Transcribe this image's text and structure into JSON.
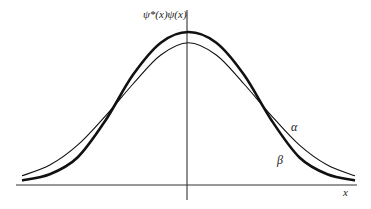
{
  "chart_data": {
    "type": "line",
    "title": "",
    "ylabel": "ψ*(x)ψ(x)",
    "xlabel": "x",
    "grid": false,
    "legend": "inline labels",
    "x_range": [
      -3,
      3
    ],
    "series": [
      {
        "name": "α",
        "description": "wider Gaussian probability density (thin line)",
        "stroke_width": 1.1,
        "x": [
          -3.0,
          -2.5,
          -2.0,
          -1.5,
          -1.0,
          -0.5,
          0.0,
          0.5,
          1.0,
          1.5,
          2.0,
          2.5,
          3.0
        ],
        "values": [
          0.06,
          0.13,
          0.26,
          0.45,
          0.66,
          0.85,
          0.93,
          0.85,
          0.66,
          0.45,
          0.26,
          0.13,
          0.06
        ]
      },
      {
        "name": "β",
        "description": "narrower, taller density (thick line)",
        "stroke_width": 2.6,
        "x": [
          -3.0,
          -2.5,
          -2.0,
          -1.5,
          -1.0,
          -0.5,
          0.0,
          0.5,
          1.0,
          1.5,
          2.0,
          2.5,
          3.0
        ],
        "values": [
          0.03,
          0.07,
          0.18,
          0.42,
          0.72,
          0.93,
          1.0,
          0.93,
          0.72,
          0.42,
          0.18,
          0.07,
          0.03
        ]
      }
    ]
  },
  "labels": {
    "y_axis": "ψ*(x)ψ(x)",
    "x_axis": "x",
    "alpha": "α",
    "beta": "β"
  }
}
